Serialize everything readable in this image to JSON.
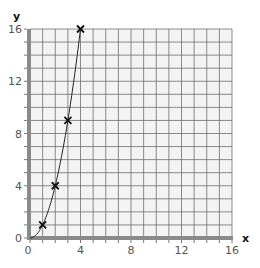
{
  "chart_data": {
    "type": "line",
    "title": "",
    "xlabel": "x",
    "ylabel": "y",
    "xlim": [
      0,
      16
    ],
    "ylim": [
      0,
      16
    ],
    "grid": true,
    "x_ticks": [
      0,
      4,
      8,
      12,
      16
    ],
    "y_ticks": [
      0,
      4,
      8,
      12,
      16
    ],
    "minor_tick_step": 1,
    "series": [
      {
        "name": "y = x^2",
        "marker": "x",
        "points": [
          {
            "x": 1,
            "y": 1
          },
          {
            "x": 2,
            "y": 4
          },
          {
            "x": 3,
            "y": 9
          },
          {
            "x": 4,
            "y": 16
          }
        ],
        "curve": "smooth through origin"
      }
    ],
    "legend": null
  },
  "axes": {
    "x_label": "x",
    "y_label": "y",
    "x_tick_labels": [
      "0",
      "4",
      "8",
      "12",
      "16"
    ],
    "y_tick_labels": [
      "0",
      "4",
      "8",
      "12",
      "16"
    ]
  },
  "colors": {
    "grid_line": "#6f6f6f",
    "grid_background": "#f4f4f4",
    "axis_band": "#8a8a8a",
    "curve": "#222222",
    "marker": "#111111",
    "tick_label": "#555555"
  }
}
